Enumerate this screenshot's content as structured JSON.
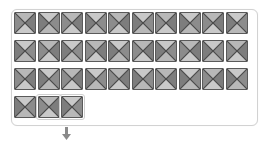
{
  "panel": {
    "border_color": "#d2d2d2",
    "background": "#ffffff"
  },
  "tiles": {
    "icon": "broken-image-placeholder-icon",
    "colors": {
      "top": "#b8b8b8",
      "bottom": "#c9c9c9",
      "left": "#8c8c8c",
      "right": "#7d7d7d",
      "border": "#5a5a5a",
      "cross": "#4a4a4a"
    },
    "rows": [
      {
        "count": 10
      },
      {
        "count": 10
      },
      {
        "count": 10
      },
      {
        "count": 3,
        "selected": [
          1,
          2
        ]
      }
    ],
    "total": 33
  },
  "drag_indicator": {
    "icon": "down-arrow-icon",
    "color": "#8a8a8a",
    "under_tile_index": 1
  }
}
